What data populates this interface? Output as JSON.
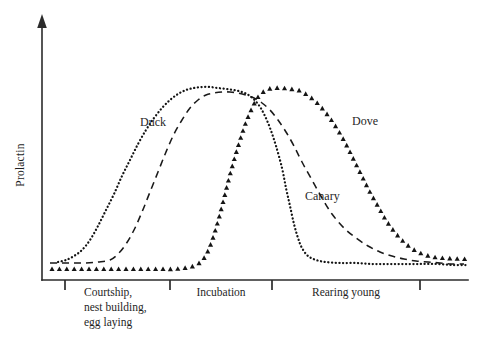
{
  "figure": {
    "y_axis_label": "Prolactin",
    "series_labels": {
      "duck": "Duck",
      "dove": "Dove",
      "canary": "Canary"
    },
    "stage_labels": {
      "courtship_line1": "Courtship,",
      "courtship_line2": "nest building,",
      "courtship_line3": "egg laying",
      "incubation": "Incubation",
      "rearing": "Rearing young"
    },
    "colors": {
      "ink": "#141414",
      "axis": "#2b2b2b",
      "background": "#ffffff"
    }
  },
  "chart_data": {
    "type": "line",
    "title": "",
    "subtitle": "",
    "xlabel": "",
    "ylabel": "Prolactin",
    "grid": false,
    "legend": "inline-annotations",
    "x_axis": {
      "kind": "categorical-stages",
      "ticks_px": [
        65,
        170,
        272,
        420
      ],
      "stage_names": [
        "Courtship, nest building, egg laying",
        "Incubation",
        "Rearing young"
      ],
      "tick_labels": [
        "",
        "",
        "",
        ""
      ],
      "range_px": [
        42,
        468
      ]
    },
    "y_axis": {
      "kind": "relative",
      "tick_labels": [],
      "ylim": [
        0,
        1
      ],
      "arrow_at_top": true
    },
    "annotations": [
      {
        "text": "Duck",
        "x_px": 140,
        "y_px": 126
      },
      {
        "text": "Dove",
        "x_px": 352,
        "y_px": 125
      },
      {
        "text": "Canary",
        "x_px": 305,
        "y_px": 200
      }
    ],
    "series": [
      {
        "name": "Duck",
        "marker": "round-dot",
        "style": "dotted",
        "x": [
          58,
          66,
          74,
          82,
          90,
          98,
          106,
          114,
          122,
          130,
          138,
          146,
          154,
          162,
          170,
          178,
          186,
          194,
          202,
          210,
          218,
          226,
          234,
          242,
          250,
          258,
          264,
          270,
          276,
          282,
          286,
          290,
          294,
          298,
          302,
          308,
          316,
          326,
          340,
          356,
          372,
          388,
          404,
          420,
          436,
          452,
          466
        ],
        "y": [
          0.09,
          0.1,
          0.12,
          0.15,
          0.2,
          0.27,
          0.35,
          0.43,
          0.52,
          0.6,
          0.68,
          0.75,
          0.81,
          0.86,
          0.9,
          0.93,
          0.95,
          0.96,
          0.965,
          0.965,
          0.96,
          0.955,
          0.95,
          0.94,
          0.92,
          0.88,
          0.83,
          0.76,
          0.67,
          0.56,
          0.46,
          0.37,
          0.28,
          0.21,
          0.16,
          0.12,
          0.1,
          0.09,
          0.085,
          0.085,
          0.08,
          0.08,
          0.08,
          0.08,
          0.08,
          0.075,
          0.075
        ]
      },
      {
        "name": "Canary",
        "marker": "none",
        "style": "dashed",
        "x": [
          50,
          62,
          74,
          86,
          98,
          110,
          118,
          126,
          134,
          142,
          150,
          158,
          166,
          174,
          182,
          190,
          198,
          206,
          214,
          222,
          230,
          238,
          246,
          254,
          262,
          270,
          278,
          286,
          294,
          302,
          312,
          322,
          332,
          344,
          356,
          368,
          380,
          392,
          404,
          416,
          428,
          440,
          452,
          464
        ],
        "y": [
          0.085,
          0.085,
          0.085,
          0.085,
          0.09,
          0.1,
          0.13,
          0.18,
          0.25,
          0.34,
          0.44,
          0.54,
          0.64,
          0.73,
          0.8,
          0.86,
          0.9,
          0.925,
          0.935,
          0.94,
          0.94,
          0.935,
          0.925,
          0.91,
          0.885,
          0.85,
          0.8,
          0.74,
          0.67,
          0.59,
          0.5,
          0.41,
          0.33,
          0.26,
          0.21,
          0.17,
          0.14,
          0.12,
          0.105,
          0.095,
          0.09,
          0.085,
          0.08,
          0.08
        ]
      },
      {
        "name": "Dove",
        "marker": "triangle",
        "style": "markers",
        "x": [
          52,
          64,
          76,
          88,
          100,
          112,
          124,
          136,
          148,
          160,
          172,
          184,
          196,
          204,
          210,
          216,
          222,
          228,
          234,
          240,
          246,
          252,
          258,
          266,
          274,
          282,
          290,
          298,
          306,
          314,
          322,
          330,
          338,
          346,
          354,
          362,
          370,
          378,
          386,
          394,
          402,
          410,
          418,
          426,
          434,
          442,
          450,
          458,
          466
        ],
        "y": [
          0.055,
          0.055,
          0.055,
          0.055,
          0.055,
          0.055,
          0.055,
          0.055,
          0.055,
          0.055,
          0.055,
          0.06,
          0.075,
          0.11,
          0.17,
          0.26,
          0.37,
          0.49,
          0.6,
          0.7,
          0.79,
          0.86,
          0.915,
          0.95,
          0.96,
          0.96,
          0.955,
          0.95,
          0.93,
          0.9,
          0.86,
          0.81,
          0.75,
          0.68,
          0.6,
          0.52,
          0.44,
          0.37,
          0.3,
          0.245,
          0.2,
          0.165,
          0.14,
          0.125,
          0.115,
          0.11,
          0.108,
          0.106,
          0.105
        ]
      }
    ]
  }
}
